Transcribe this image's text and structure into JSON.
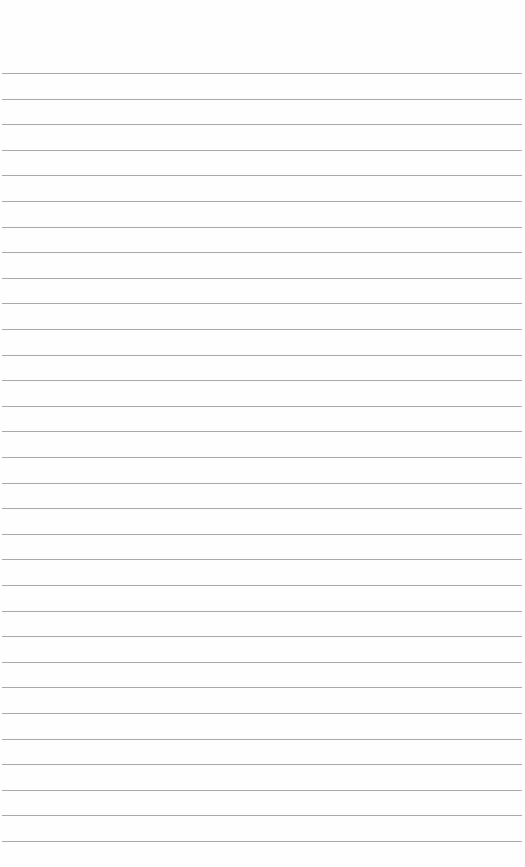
{
  "page": {
    "type": "lined-paper",
    "background_color": "#fefefe",
    "rule_color": "#9a9a9a",
    "rule_count": 31,
    "first_rule_y": 73,
    "rule_spacing": 25.6,
    "rule_left": 2,
    "rule_right_inset": 3,
    "text_lines": []
  }
}
